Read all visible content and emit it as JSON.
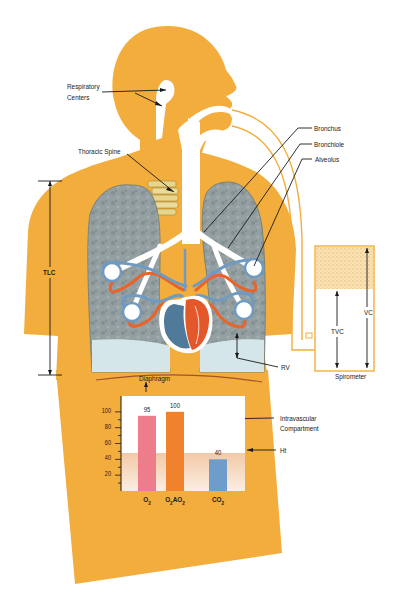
{
  "diagram": {
    "labels": {
      "respiratory_centers_1": "Respiratory",
      "respiratory_centers_2": "Centers",
      "thoracic_spine": "Thoracic Spine",
      "bronchus": "Bronchus",
      "bronchiole": "Bronchiole",
      "alveolus": "Alveolus",
      "tlc": "TLC",
      "rv": "RV",
      "diaphragm": "Diaphragm",
      "spirometer": "Spirometer",
      "tvc": "TVC",
      "vc": "VC",
      "intravascular_1": "Intravascular",
      "intravascular_2": "Compartment",
      "ht": "Ht"
    },
    "colors": {
      "body": "#f2ad3c",
      "lung": "#8f9c9e",
      "airway": "#ffffff",
      "vein": "#6f9ac2",
      "artery": "#e8642a",
      "heart_red": "#e2582a",
      "heart_blue": "#4f7a9a",
      "pleura": "#d5e6ea"
    }
  },
  "chart_data": {
    "type": "bar",
    "title": "",
    "xlabel": "",
    "ylabel": "",
    "categories": [
      "O2",
      "O2AO2",
      "CO2"
    ],
    "category_display": [
      {
        "main": "O",
        "sub": "2",
        "rest": "",
        "sub2": ""
      },
      {
        "main": "O",
        "sub": "2",
        "rest": "AO",
        "sub2": "2"
      },
      {
        "main": "CO",
        "sub": "2",
        "rest": "",
        "sub2": ""
      }
    ],
    "values": [
      95,
      100,
      40
    ],
    "value_labels": [
      "95",
      "100",
      "40"
    ],
    "colors": [
      "#ee7d8c",
      "#f0822e",
      "#6e9ccb"
    ],
    "yticks": [
      20,
      40,
      60,
      80,
      100
    ],
    "ytick_labels": [
      "20",
      "40",
      "60",
      "80",
      "100"
    ],
    "ylim": [
      0,
      120
    ],
    "ht_band_level": 48,
    "annotations": [
      "Intravascular Compartment",
      "Ht"
    ],
    "grid": false,
    "legend": "none"
  }
}
